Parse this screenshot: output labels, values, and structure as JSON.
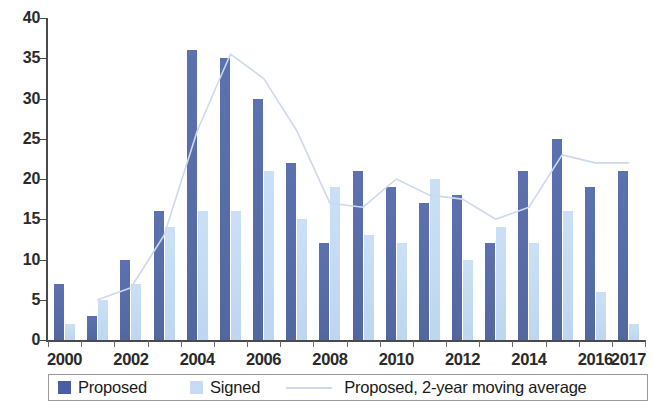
{
  "chart_data": {
    "type": "bar",
    "title": "",
    "subtitle": "",
    "xlabel": "",
    "ylabel": "",
    "ylim": [
      0,
      40
    ],
    "ytick_values": [
      0,
      5,
      10,
      15,
      20,
      25,
      30,
      35,
      40
    ],
    "ytick_labels": [
      "0",
      "5",
      "10",
      "15",
      "20",
      "25",
      "30",
      "35",
      "40"
    ],
    "grid": false,
    "legend_position": "bottom",
    "categories": [
      "2000",
      "2001",
      "2002",
      "2003",
      "2004",
      "2005",
      "2006",
      "2007",
      "2008",
      "2009",
      "2010",
      "2011",
      "2012",
      "2013",
      "2014",
      "2015",
      "2016",
      "2017"
    ],
    "xtick_labels": [
      "2000",
      "",
      "2002",
      "",
      "2004",
      "",
      "2006",
      "",
      "2008",
      "",
      "2010",
      "",
      "2012",
      "",
      "2014",
      "",
      "2016",
      "2017"
    ],
    "series": [
      {
        "name": "Proposed",
        "color": "#5b6fae",
        "values": [
          7,
          3,
          10,
          16,
          36,
          35,
          30,
          22,
          12,
          21,
          19,
          17,
          18,
          12,
          21,
          25,
          19,
          21
        ]
      },
      {
        "name": "Signed",
        "color": "#c7dcf2",
        "values": [
          2,
          5,
          7,
          14,
          16,
          16,
          21,
          15,
          19,
          13,
          12,
          20,
          10,
          14,
          12,
          16,
          6,
          2
        ]
      },
      {
        "name": "Proposed, 2-year moving average",
        "type": "line",
        "color": "#cdd9ee",
        "values": [
          null,
          5,
          6.5,
          13,
          26,
          35.5,
          32.5,
          26,
          17,
          16.5,
          20,
          18,
          17.5,
          15,
          16.5,
          23,
          22,
          22
        ]
      }
    ]
  },
  "legend": {
    "items": [
      {
        "label": "Proposed",
        "marker": "square-dark-blue"
      },
      {
        "label": "Signed",
        "marker": "square-light-blue"
      },
      {
        "label": "Proposed, 2-year moving average",
        "marker": "line-light-blue"
      }
    ]
  },
  "colors": {
    "proposed": "#5b6fae",
    "signed": "#c7dcf2",
    "moving_average": "#cdd9ee",
    "axis": "#4a4a4a",
    "text": "#1a1a1a",
    "background": "#ffffff"
  }
}
